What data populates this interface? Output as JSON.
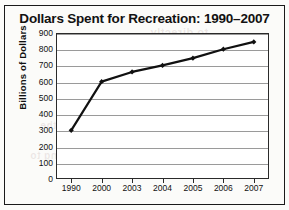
{
  "chart_data": {
    "type": "line",
    "title": "Dollars Spent for Recreation: 1990–2007",
    "xlabel": "",
    "ylabel": "Billions of Dollars",
    "categories": [
      "1990",
      "2000",
      "2003",
      "2004",
      "2005",
      "2006",
      "2007"
    ],
    "values": [
      300,
      600,
      660,
      700,
      745,
      800,
      845
    ],
    "series": [
      {
        "name": "Dollars Spent for Recreation",
        "values": [
          300,
          600,
          660,
          700,
          745,
          800,
          845
        ]
      }
    ],
    "ylim": [
      0,
      900
    ],
    "ytick_labels": [
      "0",
      "100",
      "200",
      "300",
      "400",
      "500",
      "600",
      "700",
      "800",
      "900"
    ],
    "ytick_values": [
      0,
      100,
      200,
      300,
      400,
      500,
      600,
      700,
      800,
      900
    ],
    "grid": true,
    "legend": false,
    "marker": "diamond",
    "line_color": "#111111",
    "grid_color": "#9a9a9a",
    "plot_background": "#ffffff"
  },
  "figure": {
    "border_color": "#1a1a1a",
    "background": "#fbfbf9"
  },
  "artifacts": {
    "showthrough_1": "to directly",
    "showthrough_2": "GRAPH A",
    "showthrough_3": "the",
    "showthrough_4": "going to"
  }
}
